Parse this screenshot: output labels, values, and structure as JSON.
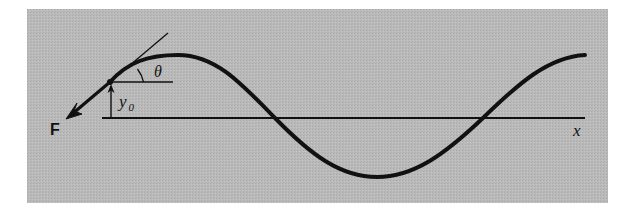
{
  "figure": {
    "background_color": "#b9b9b9",
    "ink_color": "#111111",
    "panel": {
      "x": 27,
      "y": 9,
      "width": 581,
      "height": 194
    },
    "labels": {
      "force": "F",
      "displacement_symbol": "y",
      "displacement_subscript": "0",
      "angle": "θ",
      "axis": "x"
    },
    "wave": {
      "type": "sinusoid",
      "axis_y": 118,
      "start_point": {
        "x": 110,
        "y": 82
      },
      "peak": {
        "x": 180,
        "y": 55
      },
      "zero_crossings": [
        {
          "x": 275,
          "y": 118
        },
        {
          "x": 483,
          "y": 118
        }
      ],
      "trough": {
        "x": 377,
        "y": 177
      },
      "end_point": {
        "x": 585,
        "y": 55
      }
    },
    "axis_line": {
      "x1": 102,
      "x2": 585,
      "y": 118
    },
    "reference_line": {
      "x1": 110,
      "x2": 173,
      "y": 82
    },
    "tangent_line": {
      "x1": 110,
      "y1": 82,
      "x2": 168,
      "y2": 33
    },
    "force_arrow": {
      "x1": 110,
      "y1": 82,
      "x2": 67,
      "y2": 118
    },
    "displacement_arrow": {
      "x": 111,
      "y1": 118,
      "y2": 83
    }
  }
}
